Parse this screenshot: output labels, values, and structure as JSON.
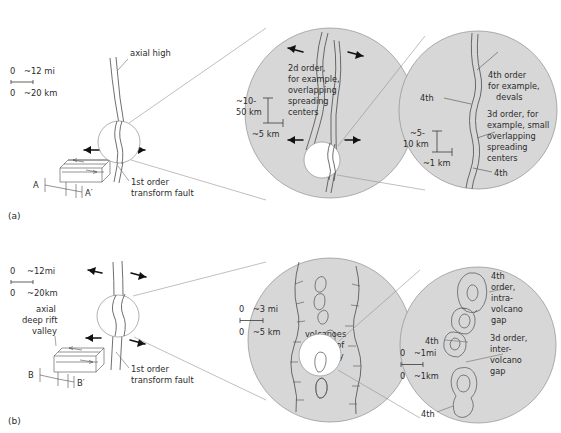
{
  "figure": {
    "panels": [
      {
        "id": "panel-a",
        "tag": "(a)",
        "scale_bar": {
          "miles_zero": "0",
          "miles": "~12 mi",
          "km_zero": "0",
          "km": "~20 km"
        },
        "map_labels": {
          "ridge_type": "axial high",
          "fault": "1st order\ntransform fault",
          "fault_line1": "1st order",
          "fault_line2": "transform fault",
          "section_start": "A",
          "section_end": "A′"
        },
        "zoom1": {
          "order_label_lines": [
            "2d order,",
            "for example,",
            "overlapping",
            "spreading",
            "centers"
          ],
          "scale_vertical_line1": "~10-",
          "scale_vertical_line2": "50 km",
          "scale_horizontal": "~5 km"
        },
        "zoom2": {
          "order4_label_lines": [
            "4th order",
            "for example,",
            "devals"
          ],
          "order3_label_lines": [
            "3d order, for",
            "example, small",
            "overlapping",
            "spreading",
            "centers"
          ],
          "tick_left": "4th",
          "tick_bottom": "4th",
          "scale_vertical_line1": "~5-",
          "scale_vertical_line2": "10 km",
          "scale_horizontal": "~1 km"
        }
      },
      {
        "id": "panel-b",
        "tag": "(b)",
        "scale_bar": {
          "miles_zero": "0",
          "miles": "~12mi",
          "km_zero": "0",
          "km": "~20km"
        },
        "map_labels": {
          "ridge_type_line1": "axial",
          "ridge_type_line2": "deep rift",
          "ridge_type_line3": "valley",
          "fault_line1": "1st order",
          "fault_line2": "transform fault",
          "section_start": "B",
          "section_end": "B′"
        },
        "zoom1": {
          "scale_miles_zero": "0",
          "scale_miles": "~3 mi",
          "scale_km_zero": "0",
          "scale_km": "~5 km",
          "volcano_label_lines": [
            "volcanoes",
            "in floor of",
            "rift valley"
          ]
        },
        "zoom2": {
          "order4_label_lines": [
            "4th",
            "order,",
            "intra-",
            "volcano",
            "gap"
          ],
          "order3_label_lines": [
            "3d order,",
            "inter-",
            "volcano",
            "gap"
          ],
          "tick_mid": "4th",
          "tick_bottom": "4th",
          "scale_miles_zero": "0",
          "scale_miles": "~1mi",
          "scale_km_zero": "0",
          "scale_km": "~1km"
        }
      }
    ],
    "colors": {
      "circle_fill": "#d7d7d7",
      "circle_stroke": "#8f8f8f",
      "line": "#4a4a4a",
      "text": "#2b2b2b",
      "arrow": "#111111",
      "background": "#ffffff"
    }
  }
}
